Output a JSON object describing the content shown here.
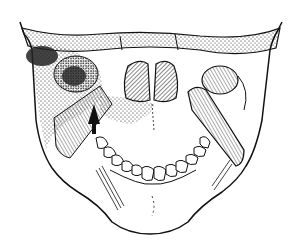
{
  "figure": {
    "style": "black ink on white",
    "colors": {
      "ink": "#111111",
      "background": "#ffffff"
    },
    "annotations": [
      {
        "type": "arrow",
        "direction": "up",
        "icon": "arrow-up-icon"
      }
    ]
  }
}
